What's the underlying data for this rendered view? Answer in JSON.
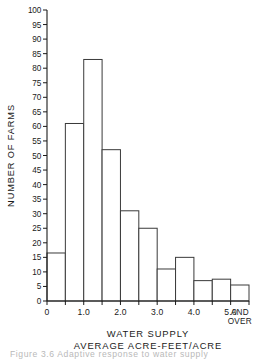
{
  "chart_data": {
    "type": "bar",
    "title": "",
    "subtitle": "",
    "xlabel": "WATER SUPPLY",
    "xlabel_line2": "AVERAGE ACRE-FEET/ACRE",
    "ylabel": "NUMBER OF FARMS",
    "xlim": [
      0,
      5.5
    ],
    "ylim": [
      0,
      100
    ],
    "grid": false,
    "legend": "none",
    "bin_width": 0.5,
    "categories": [
      "0.0-0.5",
      "0.5-1.0",
      "1.0-1.5",
      "1.5-2.0",
      "2.0-2.5",
      "2.5-3.0",
      "3.0-3.5",
      "3.5-4.0",
      "4.0-4.5",
      "4.5-5.0",
      "5.0 and over"
    ],
    "bin_starts": [
      0.0,
      0.5,
      1.0,
      1.5,
      2.0,
      2.5,
      3.0,
      3.5,
      4.0,
      4.5,
      5.0
    ],
    "bin_ends": [
      0.5,
      1.0,
      1.5,
      2.0,
      2.5,
      3.0,
      3.5,
      4.0,
      4.5,
      5.0,
      5.5
    ],
    "values": [
      16.5,
      61,
      83,
      52,
      31,
      25,
      11,
      15,
      7,
      7.5,
      5.5
    ],
    "ytick_values": [
      0,
      5,
      10,
      15,
      20,
      25,
      30,
      35,
      40,
      45,
      50,
      55,
      60,
      65,
      70,
      75,
      80,
      85,
      90,
      95,
      100
    ],
    "ytick_labels": [
      "0",
      "5",
      "10",
      "15",
      "20",
      "25",
      "30",
      "35",
      "40",
      "45",
      "50",
      "55",
      "60",
      "65",
      "70",
      "75",
      "80",
      "85",
      "90",
      "95",
      "100"
    ],
    "yminor_step": 5,
    "xtick_values": [
      0,
      0.5,
      1.0,
      1.5,
      2.0,
      2.5,
      3.0,
      3.5,
      4.0,
      4.5,
      5.0,
      5.5
    ],
    "xtick_labels": [
      "0",
      "",
      "1.0",
      "",
      "2.0",
      "",
      "3.0",
      "",
      "4.0",
      "",
      "5.0",
      ""
    ],
    "xend_label_line1": "AND",
    "xend_label_line2": "OVER",
    "xend_label_position": 5.25,
    "bar_fill": "#ffffff",
    "bar_stroke": "#3a3a3a",
    "axis_color": "#1a1a1a"
  },
  "caption": {
    "cut_off_line": "Figure 3.6  Adaptive response to water supply"
  }
}
